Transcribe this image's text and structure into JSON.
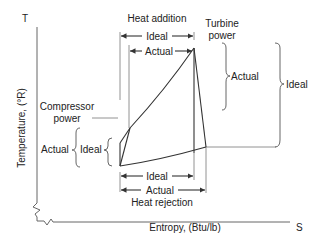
{
  "diagram": {
    "axes": {
      "y_symbol": "T",
      "y_label": "Temperature, (°R)",
      "x_symbol": "S",
      "x_label": "Entropy, (Btu/lb)"
    },
    "top": {
      "heading": "Heat addition",
      "ideal_label": "Ideal",
      "actual_label": "Actual"
    },
    "bottom": {
      "heading": "Heat rejection",
      "ideal_label": "Ideal",
      "actual_label": "Actual"
    },
    "turbine": {
      "heading_line1": "Turbine",
      "heading_line2": "power",
      "actual_label": "Actual",
      "ideal_label": "Ideal"
    },
    "compressor": {
      "heading_line1": "Compressor",
      "heading_line2": "power",
      "actual_label": "Actual",
      "ideal_label": "Ideal"
    },
    "colors": {
      "line": "#333333",
      "text": "#222222",
      "background": "#ffffff"
    }
  }
}
